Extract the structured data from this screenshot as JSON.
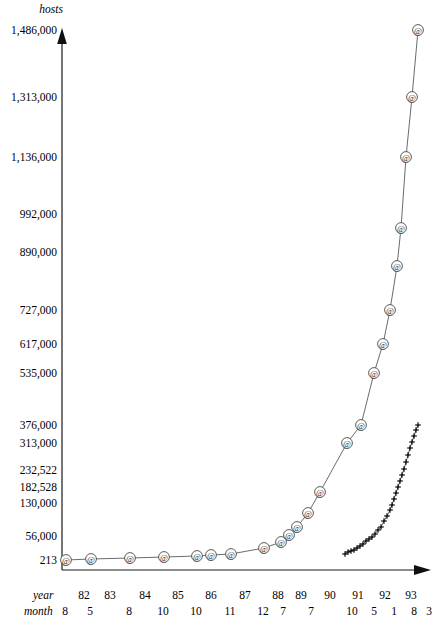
{
  "chart_data": {
    "type": "line",
    "title": "",
    "ylabel": "hosts",
    "xlabel": "year / month",
    "grid": false,
    "legend_position": "none",
    "y_axis": {
      "label": "hosts",
      "tick_labels": [
        "1,486,000",
        "1,313,000",
        "1,136,000",
        "992,000",
        "890,000",
        "727,000",
        "617,000",
        "535,000",
        "376,000",
        "313,000",
        "232,522",
        "182,528",
        "130,000",
        "56,000",
        "213"
      ],
      "tick_values": [
        1486000,
        1313000,
        1136000,
        992000,
        890000,
        727000,
        617000,
        535000,
        376000,
        313000,
        232522,
        182528,
        130000,
        56000,
        213
      ],
      "tick_y_px": [
        30,
        97,
        157,
        214,
        252,
        310,
        344,
        373,
        425,
        443,
        470,
        487,
        503,
        536,
        560
      ],
      "ylim": [
        213,
        1486000
      ]
    },
    "x_axis": {
      "year_label": "year",
      "month_label": "month",
      "years": [
        "82",
        "83",
        "84",
        "85",
        "86",
        "87",
        "88",
        "89",
        "90",
        "91",
        "92",
        "93"
      ],
      "year_x_px": [
        84,
        110,
        145,
        178,
        211,
        245,
        278,
        301,
        330,
        358,
        385,
        411
      ],
      "months": [
        "8",
        "5",
        "8",
        "10",
        "10",
        "11",
        "12",
        "7",
        "7",
        "10",
        "5",
        "1",
        "8",
        "3"
      ],
      "month_x_px": [
        65,
        90,
        129,
        163,
        196,
        230,
        263,
        283,
        311,
        352,
        374,
        394,
        414,
        429
      ]
    },
    "series": [
      {
        "name": "hosts-at-series",
        "marker": "@",
        "marker_style": "circled-at",
        "points": [
          {
            "x_px": 66,
            "y_px": 560,
            "value": 213
          },
          {
            "x_px": 91,
            "y_px": 559,
            "value": 235
          },
          {
            "x_px": 130,
            "y_px": 558,
            "value": 562
          },
          {
            "x_px": 164,
            "y_px": 557,
            "value": 1024
          },
          {
            "x_px": 197,
            "y_px": 556,
            "value": 1961
          },
          {
            "x_px": 211,
            "y_px": 555,
            "value": 2308
          },
          {
            "x_px": 231,
            "y_px": 554,
            "value": 5089
          },
          {
            "x_px": 264,
            "y_px": 548,
            "value": 28174
          },
          {
            "x_px": 281,
            "y_px": 542,
            "value": 56000
          },
          {
            "x_px": 289,
            "y_px": 535,
            "value": 80000
          },
          {
            "x_px": 297,
            "y_px": 527,
            "value": 130000
          },
          {
            "x_px": 308,
            "y_px": 513,
            "value": 182528
          },
          {
            "x_px": 320,
            "y_px": 492,
            "value": 232522
          },
          {
            "x_px": 347,
            "y_px": 443,
            "value": 313000
          },
          {
            "x_px": 361,
            "y_px": 425,
            "value": 376000
          },
          {
            "x_px": 374,
            "y_px": 373,
            "value": 535000
          },
          {
            "x_px": 383,
            "y_px": 344,
            "value": 617000
          },
          {
            "x_px": 390,
            "y_px": 310,
            "value": 727000
          },
          {
            "x_px": 397,
            "y_px": 266,
            "value": 890000
          },
          {
            "x_px": 401,
            "y_px": 228,
            "value": 992000
          },
          {
            "x_px": 406,
            "y_px": 157,
            "value": 1136000
          },
          {
            "x_px": 412,
            "y_px": 97,
            "value": 1313000
          },
          {
            "x_px": 418,
            "y_px": 30,
            "value": 1486000
          }
        ]
      },
      {
        "name": "secondary-plus-series",
        "marker": "+",
        "marker_style": "plus",
        "points": [
          {
            "x_px": 345,
            "y_px": 554
          },
          {
            "x_px": 348,
            "y_px": 552
          },
          {
            "x_px": 351,
            "y_px": 551
          },
          {
            "x_px": 354,
            "y_px": 550
          },
          {
            "x_px": 357,
            "y_px": 548
          },
          {
            "x_px": 360,
            "y_px": 546
          },
          {
            "x_px": 363,
            "y_px": 544
          },
          {
            "x_px": 366,
            "y_px": 541
          },
          {
            "x_px": 369,
            "y_px": 539
          },
          {
            "x_px": 372,
            "y_px": 537
          },
          {
            "x_px": 375,
            "y_px": 534
          },
          {
            "x_px": 378,
            "y_px": 530
          },
          {
            "x_px": 381,
            "y_px": 527
          },
          {
            "x_px": 384,
            "y_px": 521
          },
          {
            "x_px": 387,
            "y_px": 516
          },
          {
            "x_px": 390,
            "y_px": 510
          },
          {
            "x_px": 392,
            "y_px": 505
          },
          {
            "x_px": 394,
            "y_px": 499
          },
          {
            "x_px": 396,
            "y_px": 493
          },
          {
            "x_px": 398,
            "y_px": 487
          },
          {
            "x_px": 400,
            "y_px": 481
          },
          {
            "x_px": 402,
            "y_px": 475
          },
          {
            "x_px": 404,
            "y_px": 469
          },
          {
            "x_px": 406,
            "y_px": 462
          },
          {
            "x_px": 408,
            "y_px": 455
          },
          {
            "x_px": 410,
            "y_px": 448
          },
          {
            "x_px": 412,
            "y_px": 442
          },
          {
            "x_px": 414,
            "y_px": 436
          },
          {
            "x_px": 416,
            "y_px": 430
          },
          {
            "x_px": 418,
            "y_px": 425
          }
        ]
      }
    ]
  }
}
